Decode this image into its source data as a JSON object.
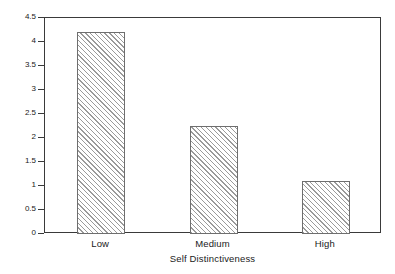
{
  "chart_data": {
    "type": "bar",
    "title": "",
    "categories": [
      "Low",
      "Medium",
      "High"
    ],
    "values": [
      4.2,
      2.25,
      1.1
    ],
    "series": [
      {
        "name": "Me-We Mutual Control Scores",
        "values": [
          4.2,
          2.25,
          1.1
        ]
      }
    ],
    "xlabel": "Self Distinctiveness",
    "ylabel": "Me-We Mutual Control Scores",
    "ylim": [
      0,
      4.5
    ],
    "ytick_labels": [
      "4.5",
      "4",
      "3.5",
      "3",
      "2.5",
      "2",
      "1.5",
      "1",
      "0.5",
      "0"
    ],
    "ytick_values": [
      4.5,
      4,
      3.5,
      3,
      2.5,
      2,
      1.5,
      1,
      0.5,
      0
    ],
    "grid": false,
    "legend": "none",
    "bar_fill": "diagonal-hatch",
    "bar_fill_color": "#9a9a9a",
    "bar_edge_color": "#6e6e6e",
    "axis_color": "#3a3a3a",
    "background_color": "#ffffff"
  },
  "axes": {
    "x_title": "Self Distinctiveness",
    "y_title": "Me-We Mutual Control Scores"
  },
  "ticks": {
    "y": [
      {
        "label": "4.5",
        "value": 4.5
      },
      {
        "label": "4",
        "value": 4
      },
      {
        "label": "3.5",
        "value": 3.5
      },
      {
        "label": "3",
        "value": 3
      },
      {
        "label": "2.5",
        "value": 2.5
      },
      {
        "label": "2",
        "value": 2
      },
      {
        "label": "1.5",
        "value": 1.5
      },
      {
        "label": "1",
        "value": 1
      },
      {
        "label": "0.5",
        "value": 0.5
      },
      {
        "label": "0",
        "value": 0
      }
    ],
    "x": [
      {
        "label": "Low"
      },
      {
        "label": "Medium"
      },
      {
        "label": "High"
      }
    ]
  }
}
